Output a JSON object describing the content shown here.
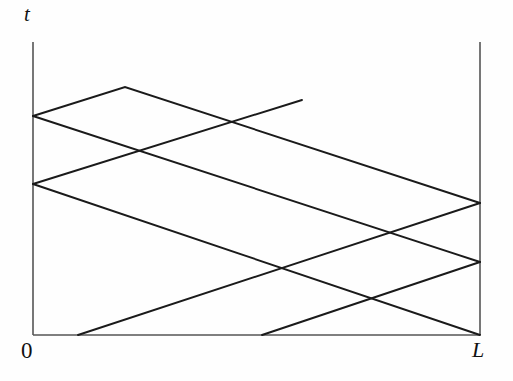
{
  "figure": {
    "title": "",
    "axis_labels": {
      "t": "t",
      "origin": "0",
      "length": "L"
    },
    "stroke_color": "#1a1a1a",
    "axis_color": "#555555",
    "background": "#fefefe"
  },
  "chart_data": {
    "type": "line",
    "title": "",
    "xlabel": "",
    "ylabel": "t",
    "x_tick_labels": [
      "0",
      "L"
    ],
    "y_tick_labels": [],
    "grid": false,
    "legend": null,
    "axis_ranges": {
      "x": [
        0,
        1
      ],
      "t": [
        0,
        1
      ]
    },
    "axes_px": {
      "x_left": 33,
      "x_right": 480,
      "t_bottom": 335,
      "t_top": 42
    },
    "boundaries": [
      {
        "name": "t-axis",
        "x1": 33,
        "y1": 42,
        "x2": 33,
        "y2": 335
      },
      {
        "name": "x-axis",
        "x1": 33,
        "y1": 335,
        "x2": 480,
        "y2": 335
      },
      {
        "name": "right-boundary",
        "x1": 480,
        "y1": 42,
        "x2": 480,
        "y2": 335
      }
    ],
    "series": [
      {
        "name": "characteristic-1",
        "slope": "negative",
        "points": [
          [
            33,
            116
          ],
          [
            125,
            87
          ],
          [
            480,
            203
          ]
        ]
      },
      {
        "name": "characteristic-2",
        "slope": "positive",
        "points": [
          [
            33,
            116
          ],
          [
            480,
            262
          ]
        ]
      },
      {
        "name": "characteristic-3",
        "slope": "negative",
        "points": [
          [
            33,
            184
          ],
          [
            302,
            100
          ]
        ]
      },
      {
        "name": "characteristic-4",
        "slope": "positive",
        "points": [
          [
            33,
            184
          ],
          [
            480,
            335
          ]
        ]
      },
      {
        "name": "characteristic-5",
        "slope": "negative",
        "points": [
          [
            78,
            335
          ],
          [
            480,
            203
          ]
        ]
      },
      {
        "name": "characteristic-6",
        "slope": "negative",
        "points": [
          [
            262,
            335
          ],
          [
            480,
            262
          ]
        ]
      }
    ],
    "vertices": [
      {
        "label": "left-reflection-upper",
        "x": 33,
        "y": 116
      },
      {
        "label": "left-reflection-lower",
        "x": 33,
        "y": 184
      },
      {
        "label": "apex",
        "x": 125,
        "y": 87
      },
      {
        "label": "right-reflection-upper",
        "x": 480,
        "y": 203
      },
      {
        "label": "right-reflection-lower",
        "x": 480,
        "y": 262
      },
      {
        "label": "bottom-start-1",
        "x": 78,
        "y": 335
      },
      {
        "label": "bottom-start-2",
        "x": 262,
        "y": 335
      },
      {
        "label": "bottom-right-corner",
        "x": 480,
        "y": 335
      },
      {
        "label": "free-end",
        "x": 302,
        "y": 100
      }
    ],
    "intersections": [
      {
        "x": 146,
        "y": 152
      },
      {
        "x": 233,
        "y": 123
      },
      {
        "x": 280,
        "y": 269
      },
      {
        "x": 370,
        "y": 297
      },
      {
        "x": 397,
        "y": 231
      }
    ]
  }
}
